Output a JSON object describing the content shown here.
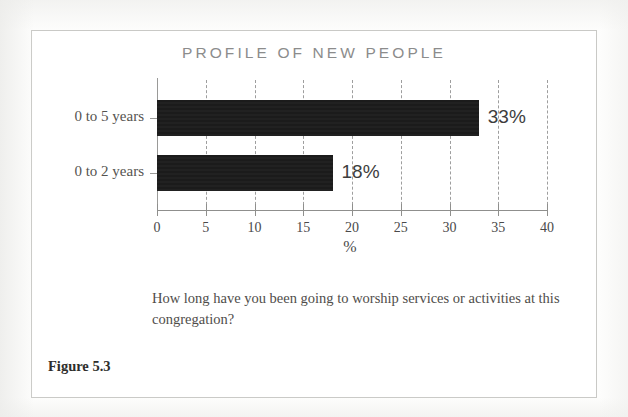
{
  "figure": {
    "number_label": "Figure 5.3",
    "caption": "How long have you been going to worship services or activities at this congregation?"
  },
  "chart_data": {
    "type": "bar",
    "orientation": "horizontal",
    "title": "PROFILE OF NEW PEOPLE",
    "categories": [
      "0 to 5 years",
      "0 to 2 years"
    ],
    "values": [
      33,
      18
    ],
    "value_labels": [
      "33%",
      "18%"
    ],
    "xlabel": "%",
    "ylabel": "",
    "xlim": [
      0,
      40
    ],
    "xticks": [
      0,
      5,
      10,
      15,
      20,
      25,
      30,
      35,
      40
    ],
    "xtick_labels": [
      "0",
      "5",
      "10",
      "15",
      "20",
      "25",
      "30",
      "35",
      "40"
    ],
    "grid": "vertical-dashed",
    "legend": "none",
    "bar_color": "#1b1b1b",
    "axis_color": "#8f8f8d",
    "gridline_color": "#9e9e9e"
  }
}
